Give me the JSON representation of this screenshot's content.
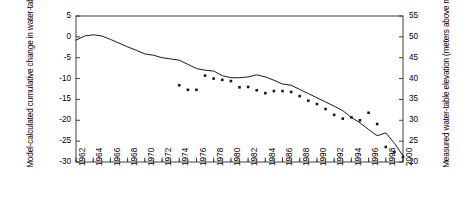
{
  "chart_data": {
    "type": "line",
    "title": "",
    "xlabel": "",
    "ylabel": "Model-calculated cumulative change in water-table elevation (m)",
    "y2label": "Measured water-table elevation (meters above mean sea level)",
    "xlim": [
      1962,
      2000
    ],
    "ylim": [
      -30,
      5
    ],
    "y2lim": [
      20,
      55
    ],
    "yticks": [
      5,
      0,
      -5,
      -10,
      -15,
      -20,
      -25,
      -30
    ],
    "y2ticks": [
      55,
      50,
      45,
      40,
      35,
      30,
      25,
      20
    ],
    "xticks": [
      1962,
      1964,
      1966,
      1968,
      1970,
      1972,
      1974,
      1976,
      1978,
      1980,
      1982,
      1984,
      1986,
      1988,
      1990,
      1992,
      1994,
      1996,
      1998,
      2000
    ],
    "xticks_minor_step": 1,
    "grid": false,
    "legend": "none",
    "series": [
      {
        "name": "Model-calculated cumulative change in water-table elevation",
        "type": "line",
        "axis": "left",
        "color": "#1a1a1a",
        "x": [
          1962,
          1963,
          1964,
          1965,
          1966,
          1967,
          1968,
          1969,
          1970,
          1971,
          1972,
          1973,
          1974,
          1975,
          1976,
          1977,
          1978,
          1979,
          1980,
          1981,
          1982,
          1983,
          1984,
          1985,
          1986,
          1987,
          1988,
          1989,
          1990,
          1991,
          1992,
          1993,
          1994,
          1995,
          1996,
          1997,
          1998,
          1999,
          2000
        ],
        "y": [
          -0.8,
          0.2,
          0.5,
          0.2,
          -0.6,
          -1.5,
          -2.4,
          -3.2,
          -4.1,
          -4.4,
          -5.0,
          -5.3,
          -5.6,
          -6.6,
          -7.6,
          -8.0,
          -8.2,
          -9.3,
          -9.8,
          -9.8,
          -9.6,
          -9.1,
          -9.6,
          -10.4,
          -11.3,
          -11.6,
          -12.6,
          -13.6,
          -14.6,
          -15.6,
          -16.6,
          -17.7,
          -19.3,
          -20.6,
          -22.2,
          -23.7,
          -23.0,
          -25.5,
          -28.5
        ]
      },
      {
        "name": "Measured water-table elevation",
        "type": "scatter",
        "axis": "right",
        "color": "#1a1a1a",
        "marker": "square",
        "x": [
          1974,
          1975,
          1976,
          1977,
          1978,
          1979,
          1980,
          1981,
          1982,
          1983,
          1984,
          1985,
          1986,
          1987,
          1988,
          1989,
          1990,
          1991,
          1992,
          1993,
          1994,
          1995,
          1996,
          1997,
          1998,
          1999,
          2000
        ],
        "y_left": [
          -11.6,
          -12.7,
          -12.7,
          -9.3,
          -10.0,
          -10.3,
          -10.6,
          -12.1,
          -12.0,
          -12.8,
          -13.5,
          -13.0,
          -13.0,
          -13.2,
          -14.2,
          -15.3,
          -16.1,
          -17.3,
          -18.7,
          -19.6,
          -19.3,
          -20.0,
          -18.2,
          -20.9,
          -26.4,
          -27.6,
          -28.8
        ],
        "y_right": [
          38.4,
          37.3,
          37.3,
          40.7,
          40.0,
          39.7,
          39.4,
          37.9,
          38.0,
          37.2,
          36.5,
          37.0,
          37.0,
          36.8,
          35.8,
          34.7,
          33.9,
          32.7,
          31.3,
          30.4,
          30.7,
          30.0,
          31.8,
          29.1,
          23.6,
          22.4,
          21.2
        ]
      }
    ]
  }
}
